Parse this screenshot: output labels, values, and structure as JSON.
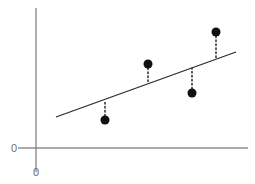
{
  "figure": {
    "name": "least-squares-regression-residuals",
    "width": 255,
    "height": 184,
    "background_color": "#ffffff"
  },
  "axes": {
    "origin_label_y": "0",
    "origin_label_x": "0",
    "axis_color": "#8c8c8c",
    "y_axis": {
      "x": 36,
      "y_top": 8,
      "y_bottom": 172
    },
    "x_axis": {
      "y": 148,
      "x_left": 18,
      "x_right": 248
    },
    "grid": false,
    "xlabel": "",
    "ylabel": "",
    "title": ""
  },
  "chart_data": {
    "type": "scatter",
    "title": "",
    "xlabel": "",
    "ylabel": "",
    "grid": false,
    "legend": null,
    "xlim": [
      0,
      255
    ],
    "ylim": [
      0,
      184
    ],
    "note": "Pixel-space coordinates: y measured downward from top of canvas.",
    "points": [
      {
        "label": "P1",
        "x": 105,
        "y": 120,
        "fit_y": 100,
        "residual": -20,
        "side": "below-line"
      },
      {
        "label": "P2",
        "x": 148,
        "y": 64,
        "fit_y": 84,
        "residual": 20,
        "side": "above-line"
      },
      {
        "label": "P3",
        "x": 192,
        "y": 93,
        "fit_y": 68,
        "residual": -25,
        "side": "below-line"
      },
      {
        "label": "P4",
        "x": 216,
        "y": 32,
        "fit_y": 59,
        "residual": 27,
        "side": "above-line"
      }
    ],
    "point_style": {
      "color": "#111111",
      "radius": 4.5,
      "marker": "filled-circle"
    },
    "fit_line": {
      "name": "regression-line",
      "x1": 56,
      "y1": 117,
      "x2": 236,
      "y2": 52,
      "color": "#2b2b2b",
      "width": 1.3,
      "slope": -0.361,
      "intercept": 137.2
    },
    "residual_lines": {
      "color": "#1a1a1a",
      "width": 1.4,
      "dash": "1.5 2.5",
      "style": "dotted-vertical"
    }
  }
}
